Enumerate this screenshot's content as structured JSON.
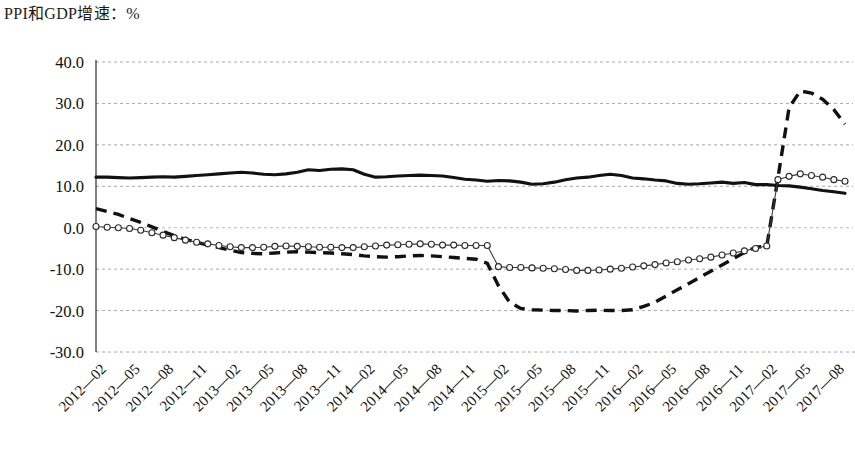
{
  "chart_data": {
    "type": "line",
    "title": "PPI和GDP增速：%",
    "xlabel": "",
    "ylabel": "",
    "ylim": [
      -30,
      40
    ],
    "yticks": [
      40.0,
      30.0,
      20.0,
      10.0,
      0.0,
      -10.0,
      -20.0,
      -30.0
    ],
    "ytick_labels": [
      "40.0",
      "30.0",
      "20.0",
      "10.0",
      "0.0",
      "-10.0",
      "-20.0",
      "-30.0"
    ],
    "grid": true,
    "legend_position": "none",
    "xtick_labels": [
      "2012—02",
      "2012—05",
      "2012—08",
      "2012—11",
      "2013—02",
      "2013—05",
      "2013—08",
      "2013—11",
      "2014—02",
      "2014—05",
      "2014—08",
      "2014—11",
      "2015—02",
      "2015—05",
      "2015—08",
      "2015—11",
      "2016—02",
      "2016—05",
      "2016—08",
      "2016—11",
      "2017—02",
      "2017—05",
      "2017—08"
    ],
    "x": [
      "2012-01",
      "2012-02",
      "2012-03",
      "2012-04",
      "2012-05",
      "2012-06",
      "2012-07",
      "2012-08",
      "2012-09",
      "2012-10",
      "2012-11",
      "2012-12",
      "2013-01",
      "2013-02",
      "2013-03",
      "2013-04",
      "2013-05",
      "2013-06",
      "2013-07",
      "2013-08",
      "2013-09",
      "2013-10",
      "2013-11",
      "2013-12",
      "2014-01",
      "2014-02",
      "2014-03",
      "2014-04",
      "2014-05",
      "2014-06",
      "2014-07",
      "2014-08",
      "2014-09",
      "2014-10",
      "2014-11",
      "2014-12",
      "2015-01",
      "2015-02",
      "2015-03",
      "2015-04",
      "2015-05",
      "2015-06",
      "2015-07",
      "2015-08",
      "2015-09",
      "2015-10",
      "2015-11",
      "2015-12",
      "2016-01",
      "2016-02",
      "2016-03",
      "2016-04",
      "2016-05",
      "2016-06",
      "2016-07",
      "2016-08",
      "2016-09",
      "2016-10",
      "2016-11",
      "2016-12",
      "2017-01",
      "2017-02",
      "2017-03",
      "2017-04",
      "2017-05",
      "2017-06",
      "2017-07",
      "2017-08"
    ],
    "series": [
      {
        "name": "GDP名义增速",
        "style": "solid-thick",
        "values": [
          12.2,
          12.2,
          12.1,
          12.0,
          12.1,
          12.2,
          12.3,
          12.2,
          12.4,
          12.6,
          12.8,
          13.0,
          13.2,
          13.4,
          13.2,
          12.9,
          12.8,
          13.0,
          13.4,
          14.0,
          13.8,
          14.1,
          14.2,
          14.0,
          12.9,
          12.2,
          12.3,
          12.5,
          12.6,
          12.7,
          12.6,
          12.5,
          12.1,
          11.7,
          11.5,
          11.2,
          11.4,
          11.3,
          11.0,
          10.5,
          10.6,
          11.0,
          11.6,
          12.0,
          12.2,
          12.6,
          12.9,
          12.6,
          12.0,
          11.8,
          11.5,
          11.3,
          10.7,
          10.5,
          10.6,
          10.8,
          11.0,
          10.7,
          10.9,
          10.4,
          10.4,
          10.2,
          10.1,
          9.8,
          9.4,
          9.0,
          8.7,
          8.3
        ]
      },
      {
        "name": "PPI全部工业品",
        "style": "dashed-thick",
        "values": [
          4.6,
          3.9,
          3.2,
          2.2,
          1.3,
          0.2,
          -0.9,
          -1.9,
          -2.8,
          -3.5,
          -4.2,
          -4.8,
          -5.4,
          -6.0,
          -6.2,
          -6.3,
          -6.1,
          -5.9,
          -5.8,
          -5.9,
          -6.0,
          -6.1,
          -6.3,
          -6.5,
          -6.8,
          -7.0,
          -7.1,
          -7.0,
          -6.8,
          -6.7,
          -6.8,
          -7.0,
          -7.2,
          -7.4,
          -7.6,
          -8.6,
          -14.0,
          -18.0,
          -19.5,
          -19.8,
          -19.9,
          -20.0,
          -20.0,
          -20.1,
          -20.0,
          -19.9,
          -20.0,
          -20.0,
          -19.8,
          -19.0,
          -18.0,
          -16.5,
          -15.0,
          -13.5,
          -12.0,
          -10.5,
          -9.0,
          -7.5,
          -6.0,
          -4.7,
          -4.5,
          12.0,
          29.0,
          33.0,
          32.5,
          31.0,
          28.5,
          25.0
        ]
      },
      {
        "name": "PPI生产资料",
        "style": "thin-circle-markers",
        "values": [
          0.3,
          0.1,
          0.0,
          -0.2,
          -0.6,
          -1.2,
          -1.8,
          -2.4,
          -3.0,
          -3.5,
          -3.9,
          -4.3,
          -4.6,
          -4.8,
          -4.8,
          -4.7,
          -4.5,
          -4.4,
          -4.5,
          -4.6,
          -4.7,
          -4.7,
          -4.8,
          -4.8,
          -4.6,
          -4.4,
          -4.2,
          -4.1,
          -4.0,
          -3.9,
          -4.0,
          -4.2,
          -4.2,
          -4.3,
          -4.3,
          -4.3,
          -9.4,
          -9.6,
          -9.6,
          -9.7,
          -9.8,
          -9.9,
          -10.1,
          -10.3,
          -10.3,
          -10.2,
          -10.0,
          -9.8,
          -9.5,
          -9.2,
          -8.9,
          -8.5,
          -8.2,
          -7.8,
          -7.5,
          -7.1,
          -6.6,
          -6.1,
          -5.6,
          -5.0,
          -4.4,
          11.6,
          12.4,
          13.0,
          12.6,
          12.2,
          11.6,
          11.2
        ]
      }
    ]
  }
}
